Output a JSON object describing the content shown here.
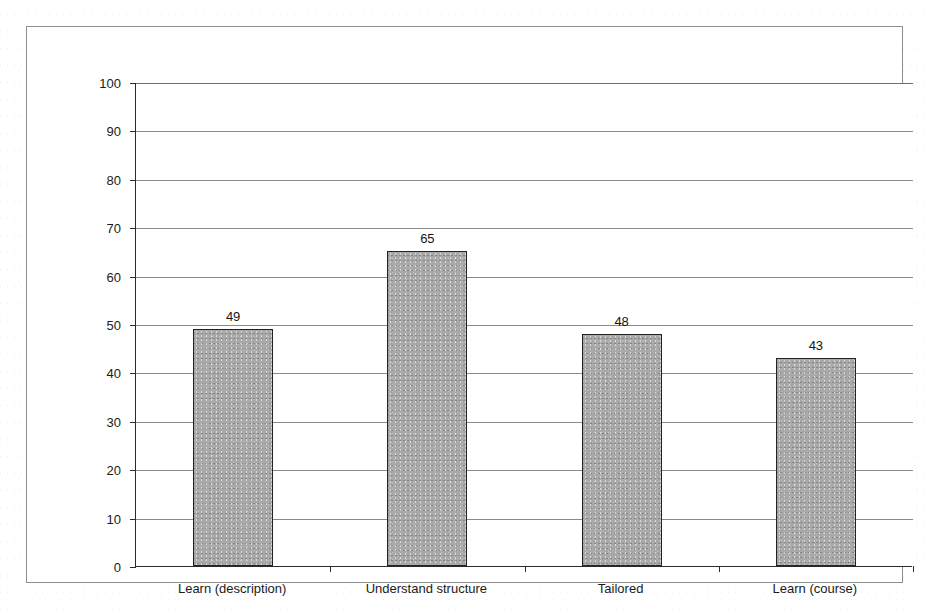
{
  "chart_data": {
    "type": "bar",
    "title": "",
    "subtitle": "",
    "xlabel": "",
    "ylabel": "Mean agreement (5-pt % scale)",
    "categories": [
      "Learn (description)",
      "Understand structure",
      "Tailored",
      "Learn (course)"
    ],
    "values": [
      49,
      65,
      48,
      43
    ],
    "value_labels": [
      "49",
      "65",
      "48",
      "43"
    ],
    "ylim": [
      0,
      100
    ],
    "ytick_step": 10,
    "ytick_labels": [
      "0",
      "10",
      "20",
      "30",
      "40",
      "50",
      "60",
      "70",
      "80",
      "90",
      "100"
    ],
    "grid": true,
    "grid_axis": "y",
    "legend": false,
    "legend_position": "none",
    "series": [
      {
        "name": "Mean agreement",
        "values": [
          49,
          65,
          48,
          43
        ]
      }
    ]
  },
  "style": {
    "bar_fill": "#a9a9a9",
    "bar_border": "#232323",
    "gridline_color": "#8a8a8a",
    "axis_color": "#2b2b2b",
    "frame_color": "#8e8e8e",
    "background": "#ffffff",
    "text_color": "#1b1b1b"
  }
}
